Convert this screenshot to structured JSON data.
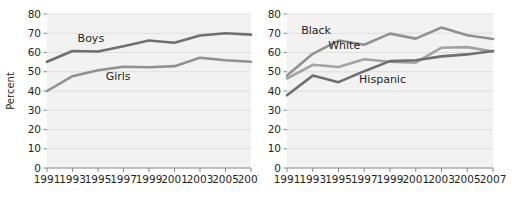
{
  "figure": {
    "ylabel": "Percent",
    "ylim": [
      0,
      80
    ],
    "yticks": [
      0,
      10,
      20,
      30,
      40,
      50,
      60,
      70,
      80
    ],
    "years": [
      1991,
      1993,
      1995,
      1997,
      1999,
      2001,
      2003,
      2005,
      2007
    ],
    "colors": {
      "dark_gray": "#6f6f6f",
      "mid_gray": "#919191",
      "light_gray": "#a3a3a3",
      "plot_background": "#f2f2f2",
      "gridline": "#d9d9d9",
      "text": "#231f20"
    }
  },
  "chart_data": [
    {
      "type": "line",
      "panel": "left",
      "title": "",
      "xlabel": "",
      "ylabel": "Percent",
      "ylim": [
        0,
        80
      ],
      "yticks": [
        0,
        10,
        20,
        30,
        40,
        50,
        60,
        70,
        80
      ],
      "grid": true,
      "legend_position": "inline-labels",
      "x": [
        1991,
        1993,
        1995,
        1997,
        1999,
        2001,
        2003,
        2005,
        2007
      ],
      "series": [
        {
          "name": "Boys",
          "color": "#6f6f6f",
          "label_x": 1993.4,
          "label_y": 65.5,
          "values": [
            55.2,
            60.8,
            60.5,
            63.2,
            66.2,
            65.1,
            68.8,
            70.0,
            69.3
          ]
        },
        {
          "name": "Girls",
          "color": "#919191",
          "label_x": 1995.6,
          "label_y": 45.5,
          "values": [
            40.0,
            47.7,
            50.8,
            52.6,
            52.3,
            52.9,
            57.3,
            56.0,
            55.2
          ]
        }
      ]
    },
    {
      "type": "line",
      "panel": "right",
      "title": "",
      "xlabel": "",
      "ylabel": "",
      "ylim": [
        0,
        80
      ],
      "yticks": [
        0,
        10,
        20,
        30,
        40,
        50,
        60,
        70,
        80
      ],
      "grid": true,
      "legend_position": "inline-labels",
      "x": [
        1991,
        1993,
        1995,
        1997,
        1999,
        2001,
        2003,
        2005,
        2007
      ],
      "series": [
        {
          "name": "Black",
          "color": "#919191",
          "label_x": 1992.1,
          "label_y": 69.5,
          "values": [
            48.0,
            59.3,
            66.2,
            64.0,
            69.8,
            67.2,
            73.0,
            69.0,
            67.0
          ]
        },
        {
          "name": "White",
          "color": "#a3a3a3",
          "label_x": 1994.2,
          "label_y": 62.0,
          "values": [
            46.5,
            53.6,
            52.5,
            56.5,
            55.2,
            54.7,
            62.5,
            62.8,
            60.5
          ]
        },
        {
          "name": "Hispanic",
          "color": "#6f6f6f",
          "label_x": 1996.6,
          "label_y": 44.0,
          "values": [
            37.8,
            48.0,
            44.6,
            50.3,
            55.5,
            56.0,
            58.0,
            59.0,
            60.8
          ]
        }
      ]
    }
  ]
}
